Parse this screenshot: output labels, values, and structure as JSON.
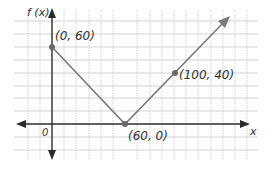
{
  "chart_data": {
    "type": "line",
    "title": "",
    "xlabel": "x",
    "ylabel": "f (x)",
    "origin_label": "0",
    "grid": true,
    "series": [
      {
        "name": "f(x)",
        "points": [
          {
            "x": 0,
            "y": 60,
            "label": "(0, 60)",
            "marked": true
          },
          {
            "x": 60,
            "y": 0,
            "label": "(60, 0)",
            "marked": true
          },
          {
            "x": 100,
            "y": 40,
            "label": "(100, 40)",
            "marked": true
          },
          {
            "x": 140,
            "y": 80,
            "label": "",
            "marked": false,
            "arrow": true
          }
        ]
      }
    ],
    "xlim": [
      -30,
      160
    ],
    "ylim": [
      -25,
      90
    ],
    "grid_step_x": 10,
    "grid_step_y": 10
  },
  "labels": {
    "y_axis": "f (x)",
    "x_axis": "x",
    "origin": "0",
    "p1": "(0, 60)",
    "p2": "(60, 0)",
    "p3": "(100, 40)"
  },
  "colors": {
    "axis": "#2b2b2b",
    "line": "#7a7a7a",
    "point": "#6a6a6a",
    "grid": "#c8c8c8"
  }
}
